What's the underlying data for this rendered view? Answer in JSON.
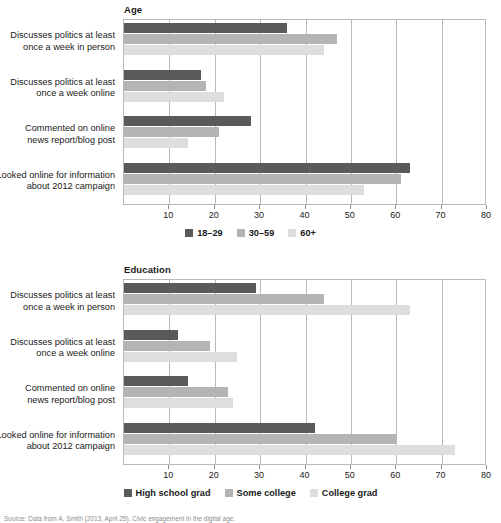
{
  "source_note": "Source: Data from A. Smith (2013, April 25). Civic engagement in the digital age.",
  "axis": {
    "ticks": [
      10,
      20,
      30,
      40,
      50,
      60,
      70,
      80
    ],
    "min": 0,
    "max": 80
  },
  "colors": {
    "series_dark": "#5a5a5a",
    "series_medium": "#b4b4b4",
    "series_light": "#dedede",
    "frame": "#b9b9b9"
  },
  "categories": [
    "Discusses politics at least once a week in person",
    "Discusses politics at least once a week online",
    "Commented on online news report/blog post",
    "Looked online for information about 2012 campaign"
  ],
  "category_lines": [
    [
      "Discusses politics at least",
      "once a week in person"
    ],
    [
      "Discusses politics at least",
      "once a week online"
    ],
    [
      "Commented on online",
      "news report/blog post"
    ],
    [
      "Looked online for information",
      "about 2012 campaign"
    ]
  ],
  "chart_data": [
    {
      "type": "bar",
      "orientation": "horizontal",
      "title": "Age",
      "xlabel": "",
      "ylabel": "",
      "xlim": [
        0,
        80
      ],
      "grid": true,
      "legend_position": "bottom",
      "categories": [
        "Discusses politics at least once a week in person",
        "Discusses politics at least once a week online",
        "Commented on online news report/blog post",
        "Looked online for information about 2012 campaign"
      ],
      "series": [
        {
          "name": "18–29",
          "color": "#5a5a5a",
          "values": [
            36,
            17,
            28,
            63
          ]
        },
        {
          "name": "30–59",
          "color": "#b4b4b4",
          "values": [
            47,
            18,
            21,
            61
          ]
        },
        {
          "name": "60+",
          "color": "#dedede",
          "values": [
            44,
            22,
            14,
            53
          ]
        }
      ]
    },
    {
      "type": "bar",
      "orientation": "horizontal",
      "title": "Education",
      "xlabel": "",
      "ylabel": "",
      "xlim": [
        0,
        80
      ],
      "grid": true,
      "legend_position": "bottom",
      "categories": [
        "Discusses politics at least once a week in person",
        "Discusses politics at least once a week online",
        "Commented on online news report/blog post",
        "Looked online for information about 2012 campaign"
      ],
      "series": [
        {
          "name": "High school grad",
          "color": "#5a5a5a",
          "values": [
            29,
            12,
            14,
            42
          ]
        },
        {
          "name": "Some college",
          "color": "#b4b4b4",
          "values": [
            44,
            19,
            23,
            60
          ]
        },
        {
          "name": "College grad",
          "color": "#dedede",
          "values": [
            63,
            25,
            24,
            73
          ]
        }
      ]
    }
  ]
}
